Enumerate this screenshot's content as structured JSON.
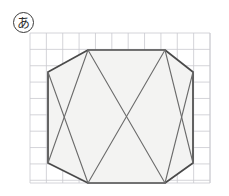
{
  "figure": {
    "label": "あ",
    "label_name": "circled-hiragana-a",
    "background_color": "#ffffff"
  },
  "grid": {
    "x": 30,
    "y": 33,
    "width": 180,
    "height": 150,
    "cell_size": 16.364,
    "columns": 11,
    "rows": 9,
    "line_color": "#c9c9cf",
    "line_width": 0.8,
    "fill_color": "#ffffff"
  },
  "shape": {
    "name": "octagon",
    "fill_color": "#f3f3f2",
    "stroke_color": "#4a4a4a",
    "stroke_width": 1.7,
    "vertices": [
      {
        "name": "top-left",
        "x": 88,
        "y": 50
      },
      {
        "name": "top-right",
        "x": 165,
        "y": 50
      },
      {
        "name": "right-top",
        "x": 193,
        "y": 72
      },
      {
        "name": "right-bottom",
        "x": 193,
        "y": 163
      },
      {
        "name": "bottom-right",
        "x": 165,
        "y": 183
      },
      {
        "name": "bottom-left",
        "x": 88,
        "y": 183
      },
      {
        "name": "left-bottom",
        "x": 48,
        "y": 163
      },
      {
        "name": "left-top",
        "x": 48,
        "y": 72
      }
    ]
  },
  "internal_lines": {
    "stroke_color": "#6b6b6b",
    "stroke_width": 1.1,
    "segments": [
      {
        "name": "left-upper-diagonal",
        "x1": 88,
        "y1": 50,
        "x2": 48,
        "y2": 163
      },
      {
        "name": "left-lower-diagonal",
        "x1": 48,
        "y1": 72,
        "x2": 88,
        "y2": 183
      },
      {
        "name": "center-left-diagonal",
        "x1": 88,
        "y1": 50,
        "x2": 165,
        "y2": 183
      },
      {
        "name": "center-right-diagonal",
        "x1": 165,
        "y1": 50,
        "x2": 88,
        "y2": 183
      },
      {
        "name": "right-upper-diagonal",
        "x1": 165,
        "y1": 50,
        "x2": 193,
        "y2": 163
      },
      {
        "name": "right-lower-diagonal",
        "x1": 193,
        "y1": 72,
        "x2": 165,
        "y2": 183
      }
    ],
    "crossing_point": {
      "name": "center-crossing",
      "x": 120,
      "y": 118
    }
  }
}
